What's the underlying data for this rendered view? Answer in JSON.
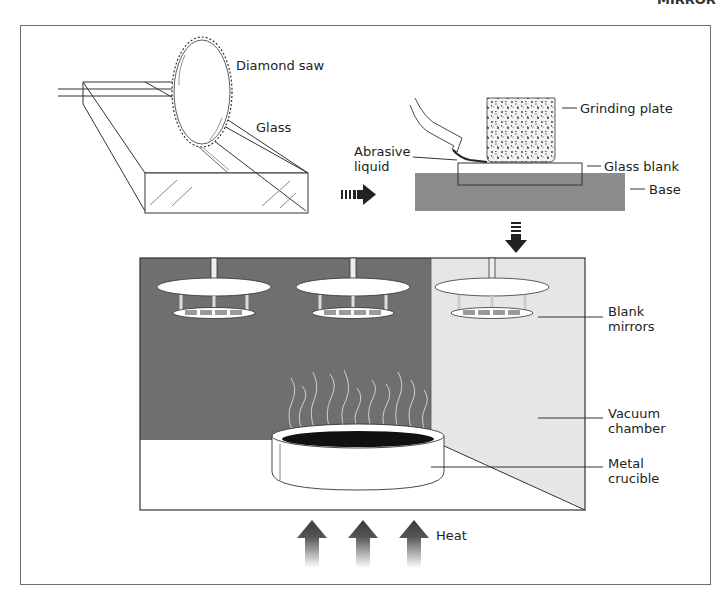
{
  "figure": {
    "corner_title_fragment": "MIRROR"
  },
  "labels": {
    "diamond_saw": "Diamond saw",
    "glass": "Glass",
    "grinding_plate": "Grinding plate",
    "abrasive_liquid": "Abrasive\nliquid",
    "glass_blank": "Glass blank",
    "base": "Base",
    "blank_mirrors": "Blank\nmirrors",
    "vacuum_chamber": "Vacuum\nchamber",
    "metal_crucible": "Metal\ncrucible",
    "heat": "Heat"
  },
  "stages": [
    {
      "id": "cutting",
      "description": "Glass cut with diamond saw"
    },
    {
      "id": "grinding",
      "description": "Glass blank ground with grinding plate and abrasive liquid on base"
    },
    {
      "id": "coating",
      "description": "Blank mirrors coated in vacuum chamber above heated metal crucible"
    }
  ],
  "colors": {
    "frame": "#6e6e6e",
    "chamber_dark": "#6f6f6f",
    "chamber_light": "#e6e6e6",
    "base_gray": "#8c8c8c",
    "stroke": "#333333",
    "molten": "#111111"
  }
}
